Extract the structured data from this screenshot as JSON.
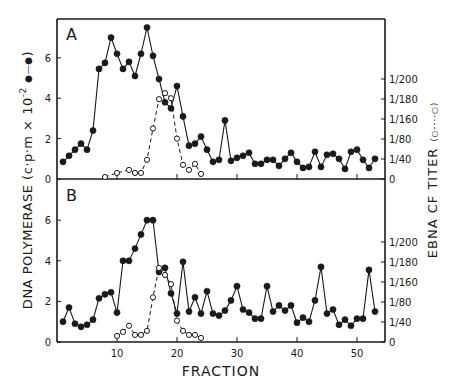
{
  "figure": {
    "panel_a_label": "A",
    "panel_b_label": "B",
    "xlabel": "FRACTION",
    "ylabel_left": "DNA POLYMERASE (c·p·m × 10⁻² ●—●)",
    "ylabel_left_main": "DNA  POLYMERASE  (c·p·m × 10",
    "ylabel_left_exp": "-2",
    "ylabel_left_legend": ")",
    "ylabel_right": "EBNA CF TITER (o----o)",
    "ylabel_right_main": "EBNA  CF  TITER",
    "ylabel_right_legend": "(○----○)"
  },
  "chart_data": [
    {
      "panel": "A",
      "type": "line",
      "title": "A",
      "xlabel": "FRACTION",
      "ylabel": "DNA POLYMERASE (c·p·m × 10^-2)",
      "y2label": "EBNA CF TITER",
      "xlim": [
        0,
        55
      ],
      "ylim": [
        0,
        7.8
      ],
      "x_ticks": [
        10,
        20,
        30,
        40,
        50
      ],
      "y_ticks": [
        0,
        2,
        4,
        6
      ],
      "y2_ticks": [
        "0",
        "1/40",
        "1/80",
        "1/160",
        "1/180",
        "1/200"
      ],
      "series": [
        {
          "name": "DNA polymerase (●—●)",
          "style": "solid-filled",
          "x": [
            1,
            2,
            3,
            4,
            5,
            6,
            7,
            8,
            9,
            10,
            11,
            12,
            13,
            14,
            15,
            16,
            17,
            18,
            19,
            20,
            21,
            22,
            23,
            24,
            25,
            26,
            27,
            28,
            29,
            30,
            31,
            32,
            33,
            34,
            35,
            36,
            37,
            38,
            39,
            40,
            41,
            42,
            43,
            44,
            45,
            46,
            47,
            48,
            49,
            50,
            51,
            52,
            53
          ],
          "values": [
            0.85,
            1.15,
            1.45,
            1.75,
            1.45,
            2.4,
            5.45,
            5.75,
            7.0,
            6.2,
            5.45,
            5.8,
            5.1,
            6.2,
            7.5,
            6.1,
            4.95,
            3.8,
            3.5,
            4.6,
            3.1,
            1.65,
            1.75,
            2.1,
            1.45,
            0.85,
            0.95,
            2.9,
            0.9,
            1.05,
            1.15,
            1.3,
            0.75,
            0.75,
            0.95,
            0.95,
            0.65,
            1.0,
            1.3,
            0.85,
            0.55,
            0.6,
            1.35,
            0.6,
            1.2,
            1.25,
            1.0,
            0.5,
            1.35,
            1.45,
            0.95,
            0.55,
            1.0
          ]
        },
        {
          "name": "EBNA CF titer (○----○)",
          "style": "dashed-open",
          "x": [
            8,
            10,
            12,
            13,
            14,
            15,
            16,
            17,
            18,
            19,
            20,
            21,
            22,
            23,
            24
          ],
          "values": [
            0.1,
            0.3,
            0.45,
            0.3,
            0.3,
            0.95,
            2.5,
            3.95,
            4.25,
            4.0,
            2.0,
            0.7,
            0.45,
            0.75,
            0.25
          ]
        }
      ]
    },
    {
      "panel": "B",
      "type": "line",
      "title": "B",
      "xlabel": "FRACTION",
      "ylabel": "DNA POLYMERASE (c·p·m × 10^-2)",
      "y2label": "EBNA CF TITER",
      "xlim": [
        0,
        55
      ],
      "ylim": [
        0,
        7.8
      ],
      "x_ticks": [
        10,
        20,
        30,
        40,
        50
      ],
      "y_ticks": [
        0,
        2,
        4,
        6
      ],
      "y2_ticks": [
        "0",
        "1/40",
        "1/80",
        "1/160",
        "1/180",
        "1/200"
      ],
      "series": [
        {
          "name": "DNA polymerase (●—●)",
          "style": "solid-filled",
          "x": [
            1,
            2,
            3,
            4,
            5,
            6,
            7,
            8,
            9,
            10,
            11,
            12,
            13,
            14,
            15,
            16,
            17,
            18,
            19,
            20,
            21,
            22,
            23,
            24,
            25,
            26,
            27,
            28,
            29,
            30,
            31,
            32,
            33,
            34,
            35,
            36,
            37,
            38,
            39,
            40,
            41,
            42,
            43,
            44,
            45,
            46,
            47,
            48,
            49,
            50,
            51,
            52,
            53
          ],
          "values": [
            1.0,
            1.7,
            0.9,
            0.75,
            0.85,
            1.1,
            2.15,
            2.35,
            2.45,
            1.45,
            4.0,
            4.0,
            4.6,
            5.3,
            6.0,
            6.0,
            3.45,
            3.65,
            2.4,
            1.4,
            3.95,
            1.5,
            2.2,
            1.4,
            2.5,
            1.4,
            1.3,
            1.55,
            2.05,
            2.75,
            1.6,
            1.45,
            1.15,
            1.15,
            2.75,
            1.5,
            1.8,
            1.55,
            1.8,
            0.95,
            1.2,
            1.0,
            2.05,
            3.7,
            1.4,
            1.6,
            0.85,
            1.1,
            0.8,
            1.15,
            1.15,
            3.55,
            1.5
          ]
        },
        {
          "name": "EBNA CF titer (○----○)",
          "style": "dashed-open",
          "x": [
            10,
            11,
            12,
            13,
            14,
            15,
            16,
            17,
            18,
            19,
            20,
            21,
            22,
            23,
            24
          ],
          "values": [
            0.3,
            0.5,
            0.8,
            0.35,
            0.35,
            0.55,
            2.2,
            3.65,
            3.3,
            2.85,
            1.05,
            0.55,
            0.35,
            0.35,
            0.2
          ]
        }
      ]
    }
  ]
}
